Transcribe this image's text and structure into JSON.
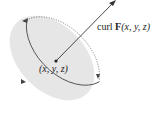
{
  "diagram": {
    "curl_label": {
      "prefix": "curl ",
      "vector": "F",
      "args": "(x, y, z)"
    },
    "point_label": "(x, y, z)",
    "colors": {
      "disk_fill": "#e6e6e6",
      "stroke": "#555555",
      "arrow": "#333333"
    }
  }
}
